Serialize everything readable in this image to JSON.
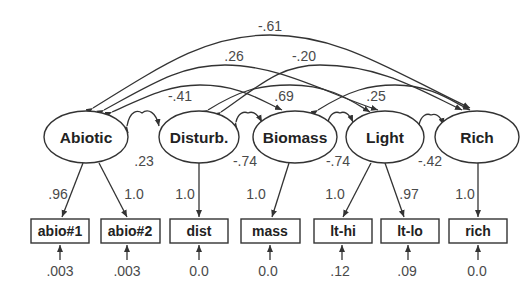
{
  "latent_nodes": [
    {
      "id": "abiotic",
      "label": "Abiotic"
    },
    {
      "id": "disturb",
      "label": "Disturb."
    },
    {
      "id": "biomass",
      "label": "Biomass"
    },
    {
      "id": "light",
      "label": "Light"
    },
    {
      "id": "rich",
      "label": "Rich"
    }
  ],
  "indicators": [
    {
      "id": "abio1",
      "label": "abio#1",
      "parent": "abiotic",
      "loading": ".96",
      "error": ".003"
    },
    {
      "id": "abio2",
      "label": "abio#2",
      "parent": "abiotic",
      "loading": "1.0",
      "error": ".003"
    },
    {
      "id": "dist",
      "label": "dist",
      "parent": "disturb",
      "loading": "1.0",
      "error": "0.0"
    },
    {
      "id": "mass",
      "label": "mass",
      "parent": "biomass",
      "loading": "1.0",
      "error": "0.0"
    },
    {
      "id": "lthi",
      "label": "lt-hi",
      "parent": "light",
      "loading": "1.0",
      "error": ".12"
    },
    {
      "id": "ltlo",
      "label": "lt-lo",
      "parent": "light",
      "loading": ".97",
      "error": ".09"
    },
    {
      "id": "rich",
      "label": "rich",
      "parent": "rich",
      "loading": "1.0",
      "error": "0.0"
    }
  ],
  "correlations": {
    "abiotic_rich": "-.61",
    "abiotic_light": ".26",
    "disturb_rich": "-.20",
    "abiotic_biomass": "-.41",
    "disturb_light": ".69",
    "biomass_rich": ".25",
    "abiotic_disturb": ".23",
    "disturb_biomass": "-.74",
    "biomass_light": "-.74",
    "light_rich": "-.42"
  }
}
